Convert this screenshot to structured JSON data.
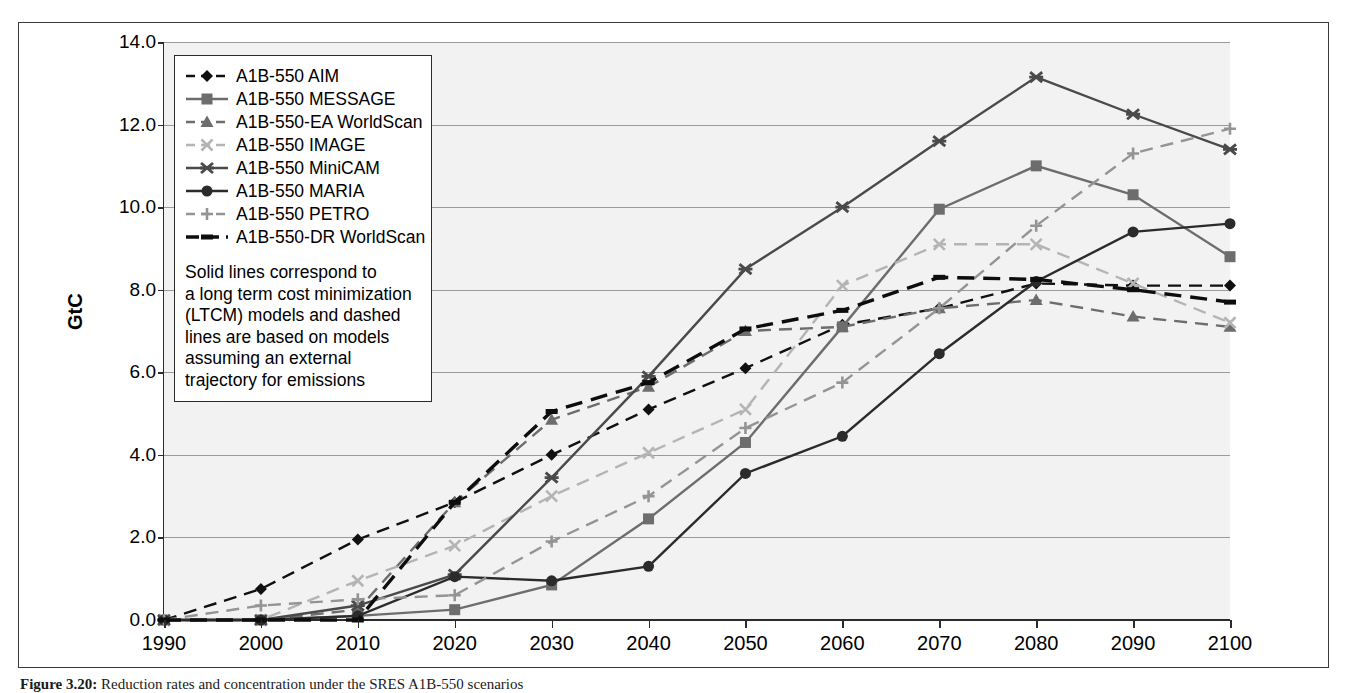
{
  "figure": {
    "caption_label": "Figure 3.20:",
    "caption_text": " Reduction rates and concentration under the SRES A1B-550 scenarios"
  },
  "chart_data": {
    "type": "line",
    "title": "",
    "xlabel": "",
    "ylabel": "GtC",
    "x": [
      1990,
      2000,
      2010,
      2020,
      2030,
      2040,
      2050,
      2060,
      2070,
      2080,
      2090,
      2100
    ],
    "xtick_labels": [
      "1990",
      "2000",
      "2010",
      "2020",
      "2030",
      "2040",
      "2050",
      "2060",
      "2070",
      "2080",
      "2090",
      "2100"
    ],
    "ytick_labels": [
      "0.0",
      "2.0",
      "4.0",
      "6.0",
      "8.0",
      "10.0",
      "12.0",
      "14.0"
    ],
    "ytick_values": [
      0.0,
      2.0,
      4.0,
      6.0,
      8.0,
      10.0,
      12.0,
      14.0
    ],
    "xlim": [
      1990,
      2100
    ],
    "ylim": [
      0.0,
      14.0
    ],
    "grid": true,
    "legend_position": "upper-left-inside",
    "series": [
      {
        "name": "A1B-550 AIM",
        "style": "dashed",
        "marker": "diamond",
        "color": "#101010",
        "values": [
          0.0,
          0.75,
          1.95,
          2.85,
          4.0,
          5.1,
          6.1,
          7.15,
          7.55,
          8.15,
          8.1,
          8.1
        ]
      },
      {
        "name": "A1B-550 MESSAGE",
        "style": "solid",
        "marker": "square",
        "color": "#6d6d6d",
        "values": [
          0.0,
          0.0,
          0.1,
          0.25,
          0.85,
          2.45,
          4.3,
          7.1,
          9.95,
          11.0,
          10.3,
          8.8
        ]
      },
      {
        "name": "A1B-550-EA WorldScan",
        "style": "dashed",
        "marker": "triangle",
        "color": "#6d6d6d",
        "values": [
          0.0,
          0.0,
          0.25,
          2.85,
          4.85,
          5.65,
          7.0,
          7.1,
          7.55,
          7.75,
          7.35,
          7.1
        ]
      },
      {
        "name": "A1B-550 IMAGE",
        "style": "dashed",
        "marker": "x",
        "color": "#b4b4b4",
        "values": [
          0.0,
          0.0,
          0.95,
          1.8,
          3.0,
          4.05,
          5.1,
          8.1,
          9.1,
          9.1,
          8.15,
          7.2
        ]
      },
      {
        "name": "A1B-550 MiniCAM",
        "style": "solid",
        "marker": "star",
        "color": "#4a4a4a",
        "values": [
          0.0,
          0.0,
          0.35,
          1.1,
          3.45,
          5.9,
          8.5,
          10.0,
          11.6,
          13.15,
          12.25,
          11.4
        ]
      },
      {
        "name": "A1B-550 MARIA",
        "style": "solid",
        "marker": "circle",
        "color": "#2b2b2b",
        "values": [
          0.0,
          0.0,
          0.1,
          1.05,
          0.95,
          1.3,
          3.55,
          4.45,
          6.45,
          8.2,
          9.4,
          9.6
        ]
      },
      {
        "name": "A1B-550 PETRO",
        "style": "dashed",
        "marker": "plus",
        "color": "#949494",
        "values": [
          0.0,
          0.35,
          0.5,
          0.6,
          1.9,
          3.0,
          4.65,
          5.75,
          7.55,
          9.55,
          11.3,
          11.9
        ]
      },
      {
        "name": "A1B-550-DR WorldScan",
        "style": "dashed-long",
        "marker": "dash",
        "color": "#0d0d0d",
        "values": [
          0.0,
          0.0,
          0.0,
          2.85,
          5.05,
          5.75,
          7.05,
          7.5,
          8.3,
          8.25,
          8.0,
          7.7
        ]
      }
    ],
    "note_lines": [
      "Solid lines correspond to",
      "a long term cost minimization",
      "(LTCM) models and dashed",
      "lines are based on models",
      "assuming an external",
      "trajectory for emissions"
    ]
  }
}
